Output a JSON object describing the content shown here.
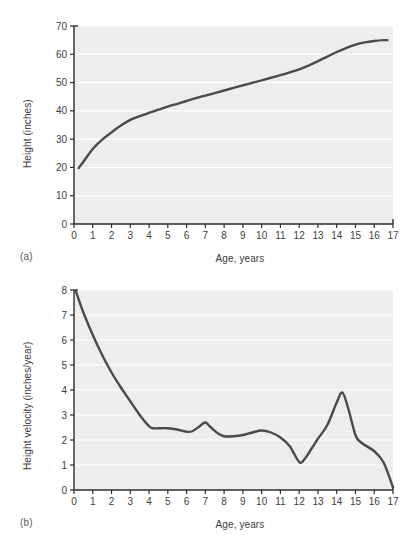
{
  "figure": {
    "panel_a_label": "(a)",
    "panel_b_label": "(b)"
  },
  "chart_data": [
    {
      "id": "height-vs-age",
      "type": "line",
      "title": "",
      "panel": "(a)",
      "xlabel": "Age, years",
      "ylabel": "Height (inches)",
      "xlim": [
        0,
        17
      ],
      "ylim": [
        0,
        70
      ],
      "xticks": [
        0,
        1,
        2,
        3,
        4,
        5,
        6,
        7,
        8,
        9,
        10,
        11,
        12,
        13,
        14,
        15,
        16,
        17
      ],
      "yticks": [
        0,
        10,
        20,
        30,
        40,
        50,
        60,
        70
      ],
      "xtick_labels": [
        "0",
        "1",
        "2",
        "3",
        "4",
        "5",
        "6",
        "7",
        "8",
        "9",
        "10",
        "11",
        "12",
        "13",
        "14",
        "15",
        "16",
        "17"
      ],
      "ytick_labels": [
        "0",
        "10",
        "20",
        "30",
        "40",
        "50",
        "60",
        "70"
      ],
      "grid": "horizontal-white",
      "legend": "none",
      "plot_bgcolor": "#ededed",
      "line_color": "#4a4a4a",
      "x": [
        0.25,
        0.5,
        1,
        1.5,
        2,
        2.5,
        3,
        3.5,
        4,
        4.5,
        5,
        5.5,
        6,
        6.5,
        7,
        7.5,
        8,
        8.5,
        9,
        9.5,
        10,
        10.5,
        11,
        11.5,
        12,
        12.5,
        13,
        13.5,
        14,
        14.5,
        15,
        15.5,
        16,
        16.5,
        16.7
      ],
      "values": [
        19.8,
        22.0,
        26.5,
        29.8,
        32.4,
        34.8,
        36.8,
        38.1,
        39.3,
        40.4,
        41.5,
        42.5,
        43.5,
        44.5,
        45.4,
        46.3,
        47.2,
        48.1,
        49.0,
        49.9,
        50.8,
        51.7,
        52.6,
        53.6,
        54.7,
        56.0,
        57.6,
        59.2,
        60.8,
        62.2,
        63.4,
        64.2,
        64.7,
        65.0,
        65.0
      ]
    },
    {
      "id": "height-velocity-vs-age",
      "type": "line",
      "title": "",
      "panel": "(b)",
      "xlabel": "Age, years",
      "ylabel": "Height velocity (inches/year)",
      "xlim": [
        0,
        17
      ],
      "ylim": [
        0,
        8
      ],
      "xticks": [
        0,
        1,
        2,
        3,
        4,
        5,
        6,
        7,
        8,
        9,
        10,
        11,
        12,
        13,
        14,
        15,
        16,
        17
      ],
      "yticks": [
        0,
        1,
        2,
        3,
        4,
        5,
        6,
        7,
        8
      ],
      "xtick_labels": [
        "0",
        "1",
        "2",
        "3",
        "4",
        "5",
        "6",
        "7",
        "8",
        "9",
        "10",
        "11",
        "12",
        "13",
        "14",
        "15",
        "16",
        "17"
      ],
      "ytick_labels": [
        "0",
        "1",
        "2",
        "3",
        "4",
        "5",
        "6",
        "7",
        "8"
      ],
      "grid": "horizontal-white",
      "legend": "none",
      "plot_bgcolor": "#ededed",
      "line_color": "#4a4a4a",
      "x": [
        0.1,
        0.5,
        1,
        1.5,
        2,
        2.5,
        3,
        3.5,
        4,
        4.2,
        4.5,
        5,
        5.5,
        6,
        6.3,
        6.7,
        7,
        7.3,
        7.7,
        8,
        8.5,
        9,
        9.5,
        10,
        10.5,
        11,
        11.5,
        12,
        12.3,
        12.7,
        13,
        13.5,
        14,
        14.3,
        14.6,
        15,
        15.3,
        16,
        16.5,
        17
      ],
      "values": [
        7.95,
        7.1,
        6.2,
        5.4,
        4.7,
        4.1,
        3.55,
        3.0,
        2.55,
        2.47,
        2.47,
        2.47,
        2.42,
        2.33,
        2.35,
        2.55,
        2.7,
        2.5,
        2.25,
        2.15,
        2.15,
        2.2,
        2.3,
        2.38,
        2.3,
        2.1,
        1.75,
        1.12,
        1.25,
        1.7,
        2.05,
        2.6,
        3.5,
        3.9,
        3.3,
        2.2,
        1.9,
        1.55,
        1.1,
        0.1
      ]
    }
  ]
}
